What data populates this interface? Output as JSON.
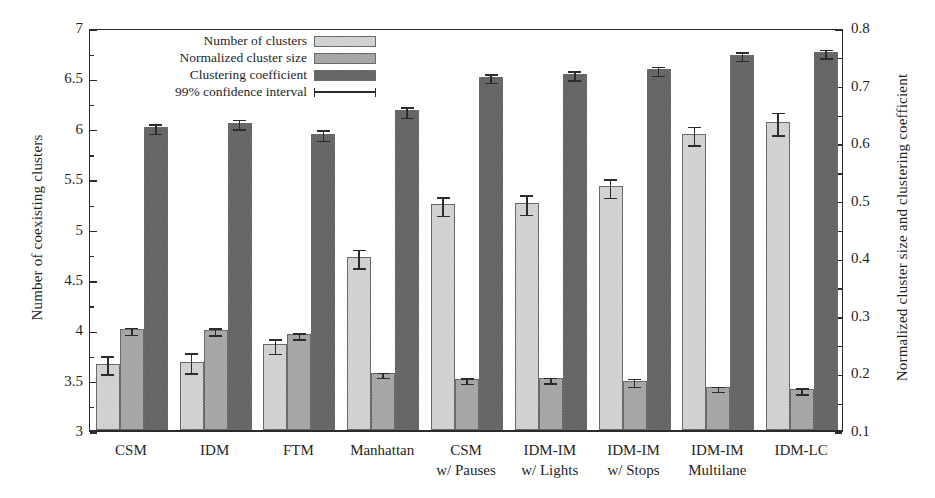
{
  "chart_data": {
    "type": "bar",
    "title": "",
    "subtitle": "",
    "xlabel": "",
    "ylabel": "Number of coexisting clusters",
    "ylabel_right": "Normalized cluster size and clustering coefficient",
    "ylim": [
      3,
      7
    ],
    "ylim_right": [
      0.1,
      0.8
    ],
    "yticks": [
      "3",
      "3.5",
      "4",
      "4.5",
      "5",
      "5.5",
      "6",
      "6.5",
      "7"
    ],
    "ytick_values": [
      3,
      3.5,
      4,
      4.5,
      5,
      5.5,
      6,
      6.5,
      7
    ],
    "yticks_right": [
      "0.1",
      "0.2",
      "0.3",
      "0.4",
      "0.5",
      "0.6",
      "0.7",
      "0.8"
    ],
    "ytick_values_right": [
      0.1,
      0.2,
      0.3,
      0.4,
      0.5,
      0.6,
      0.7,
      0.8
    ],
    "grid": false,
    "legend_position": "top-center",
    "legend": [
      {
        "label": "Number of clusters",
        "marker": "swatch",
        "color": "#dedede"
      },
      {
        "label": "Normalized cluster size",
        "marker": "swatch",
        "color": "#b4b4b4"
      },
      {
        "label": "Clustering coefficient",
        "marker": "swatch",
        "color": "#747474"
      },
      {
        "label": "99% confidence interval",
        "marker": "errorbar",
        "color": "#2b2b2b"
      }
    ],
    "categories": [
      {
        "line1": "CSM",
        "line2": ""
      },
      {
        "line1": "IDM",
        "line2": ""
      },
      {
        "line1": "FTM",
        "line2": ""
      },
      {
        "line1": "Manhattan",
        "line2": ""
      },
      {
        "line1": "CSM",
        "line2": "w/ Pauses"
      },
      {
        "line1": "IDM-IM",
        "line2": "w/ Lights"
      },
      {
        "line1": "IDM-IM",
        "line2": "w/ Stops"
      },
      {
        "line1": "IDM-IM",
        "line2": "Multilane"
      },
      {
        "line1": "IDM-LC",
        "line2": ""
      }
    ],
    "series": [
      {
        "name": "Number of clusters",
        "axis": "left",
        "color": "#dedede",
        "values": [
          3.66,
          3.68,
          3.85,
          4.72,
          5.24,
          5.25,
          5.42,
          5.94,
          6.06
        ],
        "err_low": [
          3.57,
          3.58,
          3.77,
          4.62,
          5.14,
          5.15,
          5.32,
          5.84,
          5.94
        ],
        "err_high": [
          3.76,
          3.79,
          3.93,
          4.82,
          5.34,
          5.36,
          5.52,
          6.04,
          6.18
        ]
      },
      {
        "name": "Normalized cluster size",
        "axis": "right",
        "color": "#b4b4b4",
        "values": [
          0.275,
          0.274,
          0.266,
          0.199,
          0.189,
          0.19,
          0.186,
          0.174,
          0.171
        ],
        "err_low": [
          0.268,
          0.267,
          0.26,
          0.193,
          0.183,
          0.184,
          0.178,
          0.169,
          0.165
        ],
        "err_high": [
          0.283,
          0.282,
          0.273,
          0.205,
          0.195,
          0.196,
          0.194,
          0.18,
          0.178
        ]
      },
      {
        "name": "Clustering coefficient",
        "axis": "right",
        "color": "#747474",
        "values": [
          0.626,
          0.634,
          0.615,
          0.655,
          0.714,
          0.719,
          0.727,
          0.752,
          0.757
        ],
        "err_low": [
          0.617,
          0.625,
          0.605,
          0.645,
          0.706,
          0.71,
          0.718,
          0.744,
          0.748
        ],
        "err_high": [
          0.636,
          0.644,
          0.626,
          0.666,
          0.723,
          0.728,
          0.736,
          0.761,
          0.766
        ]
      }
    ]
  }
}
